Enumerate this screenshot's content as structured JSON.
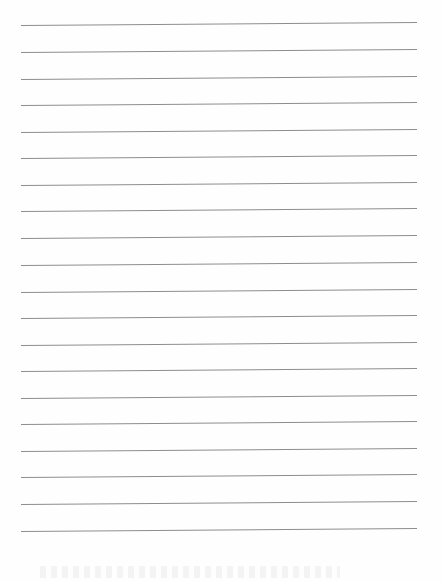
{
  "document": {
    "type": "lined-paper",
    "line_count": 20,
    "line_color": "#8d8d8d",
    "background_color": "#fefefe",
    "line_left_px": 21,
    "line_right_px": 417,
    "first_line_y_px": 25,
    "line_spacing_px": 26.6,
    "lines": [
      {
        "y": 25
      },
      {
        "y": 52
      },
      {
        "y": 79
      },
      {
        "y": 105
      },
      {
        "y": 132
      },
      {
        "y": 158
      },
      {
        "y": 185
      },
      {
        "y": 211
      },
      {
        "y": 238
      },
      {
        "y": 265
      },
      {
        "y": 292
      },
      {
        "y": 318
      },
      {
        "y": 345
      },
      {
        "y": 371
      },
      {
        "y": 398
      },
      {
        "y": 424
      },
      {
        "y": 451
      },
      {
        "y": 477
      },
      {
        "y": 504
      },
      {
        "y": 531
      }
    ]
  }
}
